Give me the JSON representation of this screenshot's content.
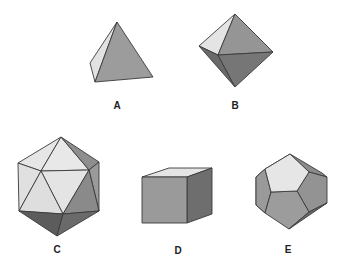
{
  "figure": {
    "shapes": [
      {
        "id": "A",
        "label": "A",
        "name": "tetrahedron",
        "label_pos": [
          117,
          100
        ]
      },
      {
        "id": "B",
        "label": "B",
        "name": "octahedron",
        "label_pos": [
          235,
          100
        ]
      },
      {
        "id": "C",
        "label": "C",
        "name": "icosahedron",
        "label_pos": [
          57,
          244
        ]
      },
      {
        "id": "D",
        "label": "D",
        "name": "cube",
        "label_pos": [
          178,
          245
        ]
      },
      {
        "id": "E",
        "label": "E",
        "name": "dodecahedron",
        "label_pos": [
          288,
          244
        ]
      }
    ],
    "colors": {
      "light_face": "#e4e4e4",
      "mid_face": "#9a9a9a",
      "dark_face": "#6e6e6e",
      "darker_face": "#5a5a5a",
      "edge": "#3a3a3a",
      "label": "#222222"
    }
  }
}
